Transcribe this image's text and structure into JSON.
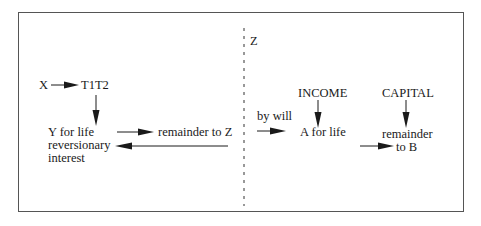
{
  "diagram": {
    "divider_label": "Z",
    "left": {
      "settlor": "X",
      "trustees": "T1T2",
      "life_tenant_lines": [
        "Y for life",
        "reversionary",
        "interest"
      ],
      "remainder": "remainder to Z"
    },
    "right": {
      "transfer_label": "by will",
      "income_label": "INCOME",
      "income_beneficiary": "A for life",
      "capital_label": "CAPITAL",
      "capital_remainder": "remainder",
      "capital_beneficiary": "to B"
    }
  },
  "colors": {
    "line": "#1a1a1a",
    "frame": "#555555",
    "background": "#ffffff"
  }
}
